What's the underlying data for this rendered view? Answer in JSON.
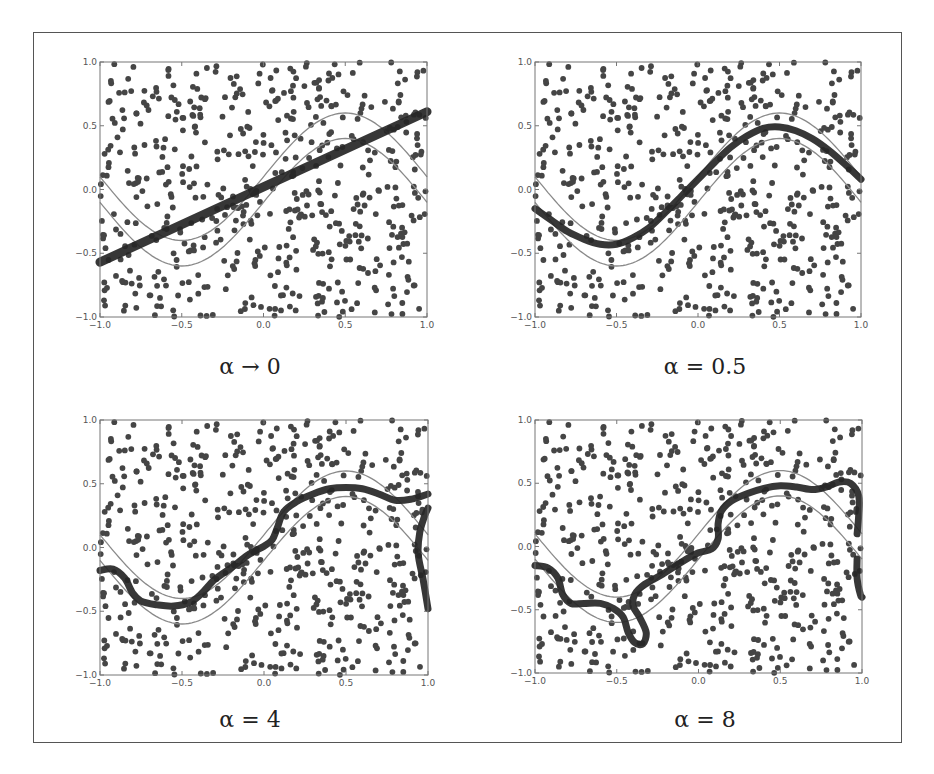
{
  "colors": {
    "frame": "#555555",
    "axes": "#777777",
    "dots": "#454545",
    "band": "#8a8a8a",
    "fit": "#262626"
  },
  "chart_data": [
    {
      "type": "scatter",
      "title": "",
      "caption": "α → 0",
      "xlabel": "",
      "ylabel": "",
      "xlim": [
        -1.0,
        1.0
      ],
      "ylim": [
        -1.0,
        1.0
      ],
      "xticks": [
        "-1.0",
        "-0.5",
        "0.0",
        "0.5",
        "1.0"
      ],
      "yticks": [
        "-1.0",
        "-0.5",
        "0.0",
        "0.5",
        "1.0"
      ],
      "grid": false,
      "band": {
        "center": "0.5*sin(pi*x)",
        "offsets": [
          0.1,
          -0.1
        ]
      },
      "fit_curve": [
        [
          -1.0,
          -0.57
        ],
        [
          1.0,
          0.61
        ]
      ],
      "fit_segments": []
    },
    {
      "type": "scatter",
      "title": "",
      "caption": "α = 0.5",
      "xlabel": "",
      "ylabel": "",
      "xlim": [
        -1.0,
        1.0
      ],
      "ylim": [
        -1.0,
        1.0
      ],
      "xticks": [
        "-1.0",
        "-0.5",
        "0.0",
        "0.5",
        "1.0"
      ],
      "yticks": [
        "-1.0",
        "-0.5",
        "0.0",
        "0.5",
        "1.0"
      ],
      "grid": false,
      "band": {
        "center": "0.5*sin(pi*x)",
        "offsets": [
          0.1,
          -0.1
        ]
      },
      "fit_curve": [
        [
          -1.0,
          -0.15
        ],
        [
          -0.9,
          -0.24
        ],
        [
          -0.8,
          -0.33
        ],
        [
          -0.7,
          -0.39
        ],
        [
          -0.6,
          -0.43
        ],
        [
          -0.5,
          -0.43
        ],
        [
          -0.4,
          -0.38
        ],
        [
          -0.3,
          -0.3
        ],
        [
          -0.2,
          -0.18
        ],
        [
          -0.1,
          -0.05
        ],
        [
          0.0,
          0.08
        ],
        [
          0.1,
          0.21
        ],
        [
          0.2,
          0.33
        ],
        [
          0.3,
          0.42
        ],
        [
          0.4,
          0.48
        ],
        [
          0.5,
          0.49
        ],
        [
          0.6,
          0.46
        ],
        [
          0.7,
          0.4
        ],
        [
          0.8,
          0.31
        ],
        [
          0.9,
          0.2
        ],
        [
          1.0,
          0.08
        ]
      ],
      "fit_segments": []
    },
    {
      "type": "scatter",
      "title": "",
      "caption": "α = 4",
      "xlabel": "",
      "ylabel": "",
      "xlim": [
        -1.0,
        1.0
      ],
      "ylim": [
        -1.0,
        1.0
      ],
      "xticks": [
        "-1.0",
        "-0.5",
        "0.0",
        "0.5",
        "1.0"
      ],
      "yticks": [
        "-1.0",
        "-0.5",
        "0.0",
        "0.5",
        "1.0"
      ],
      "grid": false,
      "band": {
        "center": "0.5*sin(pi*x)",
        "offsets": [
          0.1,
          -0.1
        ]
      },
      "fit_curve": [
        [
          -1.0,
          -0.18
        ],
        [
          -0.92,
          -0.17
        ],
        [
          -0.85,
          -0.24
        ],
        [
          -0.8,
          -0.36
        ],
        [
          -0.75,
          -0.42
        ],
        [
          -0.65,
          -0.45
        ],
        [
          -0.55,
          -0.46
        ],
        [
          -0.45,
          -0.43
        ],
        [
          -0.38,
          -0.36
        ],
        [
          -0.3,
          -0.25
        ],
        [
          -0.2,
          -0.16
        ],
        [
          -0.1,
          -0.06
        ],
        [
          0.0,
          0.01
        ],
        [
          0.05,
          0.06
        ],
        [
          0.08,
          0.15
        ],
        [
          0.12,
          0.28
        ],
        [
          0.2,
          0.36
        ],
        [
          0.3,
          0.42
        ],
        [
          0.4,
          0.46
        ],
        [
          0.5,
          0.47
        ],
        [
          0.6,
          0.46
        ],
        [
          0.7,
          0.42
        ],
        [
          0.8,
          0.37
        ],
        [
          0.9,
          0.38
        ],
        [
          1.0,
          0.42
        ]
      ],
      "fit_segments": [
        [
          [
            1.0,
            -0.48
          ],
          [
            0.97,
            -0.25
          ],
          [
            0.94,
            -0.05
          ],
          [
            0.95,
            0.12
          ],
          [
            0.98,
            0.25
          ],
          [
            1.0,
            0.31
          ]
        ]
      ]
    },
    {
      "type": "scatter",
      "title": "",
      "caption": "α = 8",
      "xlabel": "",
      "ylabel": "",
      "xlim": [
        -1.0,
        1.0
      ],
      "ylim": [
        -1.0,
        1.0
      ],
      "xticks": [
        "-1.0",
        "-0.5",
        "0.0",
        "0.5",
        "1.0"
      ],
      "yticks": [
        "-1.0",
        "-0.5",
        "0.0",
        "0.5",
        "1.0"
      ],
      "grid": false,
      "band": {
        "center": "0.5*sin(pi*x)",
        "offsets": [
          0.1,
          -0.1
        ]
      },
      "fit_curve": [
        [
          -1.0,
          -0.15
        ],
        [
          -0.92,
          -0.17
        ],
        [
          -0.86,
          -0.25
        ],
        [
          -0.83,
          -0.38
        ],
        [
          -0.78,
          -0.45
        ],
        [
          -0.7,
          -0.45
        ],
        [
          -0.6,
          -0.45
        ],
        [
          -0.52,
          -0.49
        ],
        [
          -0.46,
          -0.56
        ],
        [
          -0.43,
          -0.68
        ],
        [
          -0.39,
          -0.76
        ],
        [
          -0.34,
          -0.77
        ],
        [
          -0.32,
          -0.68
        ],
        [
          -0.36,
          -0.56
        ],
        [
          -0.4,
          -0.47
        ],
        [
          -0.39,
          -0.38
        ],
        [
          -0.33,
          -0.3
        ],
        [
          -0.22,
          -0.22
        ],
        [
          -0.1,
          -0.12
        ],
        [
          0.0,
          -0.05
        ],
        [
          0.08,
          -0.02
        ],
        [
          0.12,
          0.06
        ],
        [
          0.12,
          0.18
        ],
        [
          0.14,
          0.28
        ],
        [
          0.2,
          0.36
        ],
        [
          0.3,
          0.42
        ],
        [
          0.4,
          0.46
        ],
        [
          0.5,
          0.48
        ],
        [
          0.6,
          0.47
        ],
        [
          0.7,
          0.45
        ],
        [
          0.78,
          0.47
        ],
        [
          0.86,
          0.51
        ],
        [
          0.93,
          0.5
        ],
        [
          0.98,
          0.4
        ],
        [
          0.98,
          0.25
        ],
        [
          0.97,
          0.1
        ]
      ],
      "fit_segments": [
        [
          [
            0.97,
            -0.1
          ],
          [
            0.97,
            -0.25
          ],
          [
            0.99,
            -0.38
          ],
          [
            1.0,
            -0.4
          ]
        ]
      ]
    }
  ]
}
